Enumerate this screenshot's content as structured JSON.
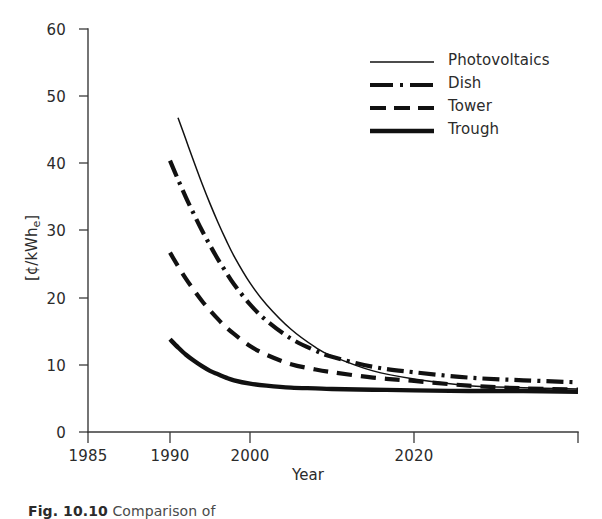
{
  "chart_data": {
    "type": "line",
    "title": "",
    "xlabel": "Year",
    "ylabel": "[¢/kWhₑ]",
    "ylabel_main": "[¢/kWh",
    "ylabel_sub": "e",
    "ylabel_close": "]",
    "ylim": [
      0,
      60
    ],
    "xlim": [
      1985,
      2050
    ],
    "grid": false,
    "legend_position": "top-right",
    "yticks": [
      0,
      10,
      20,
      30,
      40,
      50,
      60
    ],
    "ytick_labels": [
      "0",
      "10",
      "20",
      "30",
      "40",
      "50",
      "60"
    ],
    "xticks": [
      1985,
      1990,
      2000,
      2020,
      2050
    ],
    "xtick_labels": [
      "1985",
      "1990",
      "2000",
      "2020",
      ""
    ],
    "x_axis_note": "compressed non-linear time axis",
    "series": [
      {
        "name": "Photovoltaics",
        "style": "thin-solid",
        "x": [
          1991,
          1992,
          1993,
          1994,
          1995,
          1996,
          1997,
          1998,
          2000,
          2002,
          2005,
          2008,
          2010,
          2015,
          2020,
          2030,
          2040,
          2050
        ],
        "values": [
          46.8,
          43.5,
          40.2,
          37.0,
          34.0,
          31.2,
          28.6,
          26.2,
          22.2,
          19.0,
          15.3,
          12.6,
          11.3,
          9.1,
          7.9,
          6.9,
          6.6,
          6.4
        ]
      },
      {
        "name": "Dish",
        "style": "dash-dot",
        "x": [
          1990,
          1991,
          1992,
          1993,
          1994,
          1995,
          1996,
          1997,
          1998,
          2000,
          2002,
          2005,
          2008,
          2010,
          2015,
          2020,
          2030,
          2040,
          2050
        ],
        "values": [
          40.4,
          37.6,
          34.9,
          32.4,
          30.0,
          27.8,
          25.7,
          23.8,
          22.0,
          19.0,
          16.6,
          13.9,
          12.1,
          11.2,
          9.7,
          8.9,
          8.1,
          7.7,
          7.4
        ]
      },
      {
        "name": "Tower",
        "style": "dashed",
        "x": [
          1990,
          1991,
          1992,
          1993,
          1994,
          1995,
          1996,
          1997,
          1998,
          2000,
          2002,
          2005,
          2008,
          2010,
          2015,
          2020,
          2030,
          2040,
          2050
        ],
        "values": [
          26.7,
          24.7,
          22.8,
          21.1,
          19.5,
          18.1,
          16.8,
          15.6,
          14.6,
          12.8,
          11.5,
          10.1,
          9.3,
          8.9,
          8.1,
          7.6,
          6.9,
          6.5,
          6.3
        ]
      },
      {
        "name": "Trough",
        "style": "thick-solid",
        "x": [
          1990,
          1991,
          1992,
          1993,
          1994,
          1995,
          1996,
          1997,
          1998,
          2000,
          2002,
          2005,
          2008,
          2010,
          2015,
          2020,
          2030,
          2040,
          2050
        ],
        "values": [
          13.8,
          12.6,
          11.5,
          10.6,
          9.8,
          9.1,
          8.6,
          8.1,
          7.7,
          7.2,
          6.9,
          6.6,
          6.5,
          6.4,
          6.3,
          6.2,
          6.1,
          6.1,
          6.0
        ]
      }
    ]
  },
  "legend": {
    "items": [
      {
        "label": "Photovoltaics",
        "sample": "thin-solid-line-sample"
      },
      {
        "label": "Dish",
        "sample": "dash-dot-line-sample"
      },
      {
        "label": "Tower",
        "sample": "dashed-line-sample"
      },
      {
        "label": "Trough",
        "sample": "thick-solid-line-sample"
      }
    ]
  },
  "axis": {
    "x_title": "Year",
    "y_title_main": "[¢/kWh",
    "y_title_sub": "e",
    "y_title_close": "]",
    "ytick_0": "0",
    "ytick_10": "10",
    "ytick_20": "20",
    "ytick_30": "30",
    "ytick_40": "40",
    "ytick_50": "50",
    "ytick_60": "60",
    "xtick_1985": "1985",
    "xtick_1990": "1990",
    "xtick_2000": "2000",
    "xtick_2020": "2020"
  },
  "caption": {
    "figure_number": "Fig. 10.10",
    "text": "Comparison of"
  },
  "colors": {
    "ink": "#231f20",
    "axis": "#3a3a3a",
    "background": "#ffffff"
  }
}
